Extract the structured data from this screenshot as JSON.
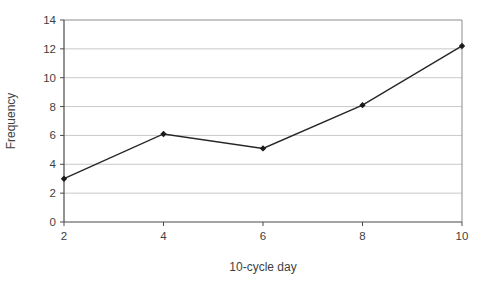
{
  "chart_data": {
    "type": "line",
    "title": "",
    "xlabel": "10-cycle day",
    "ylabel": "Frequency",
    "x": [
      2,
      4,
      6,
      8,
      10
    ],
    "series": [
      {
        "name": "Frequency",
        "values": [
          3,
          6.1,
          5.1,
          8.1,
          12.2
        ]
      }
    ],
    "xlim": [
      2,
      10
    ],
    "ylim": [
      0,
      14
    ],
    "x_ticks": [
      "2",
      "4",
      "6",
      "8",
      "10"
    ],
    "y_ticks": [
      "0",
      "2",
      "4",
      "6",
      "8",
      "10",
      "12",
      "14"
    ],
    "grid": "horizontal-only",
    "legend_position": "none",
    "marker": "diamond",
    "colors": {
      "background": "#ffffff",
      "line": "#262626",
      "marker_fill": "#1a1a1a",
      "gridline": "#c9c9c9",
      "axis": "#4a4a4a",
      "plot_border": "#8c8c8c",
      "tick_text": "#3f3f3f",
      "title_text": "#3f3f3f"
    }
  }
}
